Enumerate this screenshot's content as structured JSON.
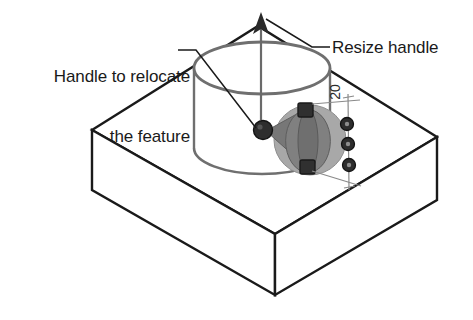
{
  "figure": {
    "background_color": "#ffffff",
    "line_color": "#1a1a1a",
    "handle_fill": "#3a3a3a",
    "cone_fill": "#8c8c8c",
    "disc_fill": "#a5a5a5",
    "cylinder_edge_color": "#6f6f6f",
    "thin_line_color": "#8a8a8a"
  },
  "annotations": {
    "relocate": {
      "line1": "Handle to relocate",
      "line2": "the feature",
      "leader_name": "relocate-leader-line"
    },
    "resize": {
      "label": "Resize handle",
      "leader_name": "resize-leader-line"
    }
  },
  "dimension": {
    "value": "20",
    "orientation": "vertical-rotated",
    "handle_count": 3
  },
  "geometry": {
    "block": {
      "name": "rectangular-block",
      "top_face": "92,130 258,26 437,137 275,234",
      "front_left_face": "92,130 275,234 275,295 92,190",
      "front_right_face": "275,234 437,137 437,200 275,295"
    },
    "cylinder": {
      "name": "cylindrical-boss",
      "center_x": 262,
      "top_y": 68,
      "bottom_y": 148,
      "rx": 68,
      "ry": 26
    },
    "resize_arrow": {
      "name": "vertical-resize-arrow",
      "tip_x": 261,
      "tip_y": 14,
      "tail_y": 120
    },
    "relocate_handle": {
      "name": "relocate-ball-handle",
      "cx": 263,
      "cy": 130,
      "r": 9
    },
    "cone_handle": {
      "name": "move-cone-handle",
      "apex_x": 266,
      "apex_y": 130
    },
    "square_handles": [
      {
        "name": "square-handle-upper",
        "cx": 305,
        "cy": 110
      },
      {
        "name": "square-handle-lower",
        "cx": 307,
        "cy": 167
      }
    ],
    "dimension_handles": [
      {
        "name": "dim-handle-1",
        "cx": 347,
        "cy": 124
      },
      {
        "name": "dim-handle-2",
        "cx": 348,
        "cy": 144
      },
      {
        "name": "dim-handle-3",
        "cx": 349,
        "cy": 165
      }
    ]
  }
}
